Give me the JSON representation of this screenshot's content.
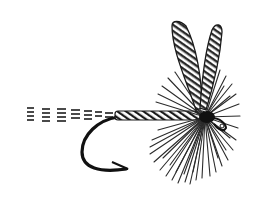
{
  "image": {
    "subject": "Dry fly fishing lure illustration",
    "style": "black-and-white engraving",
    "colors": {
      "background": "#ffffff",
      "ink": "#1a1a1a",
      "mid": "#555555"
    },
    "parts": [
      "tail",
      "hook-shank",
      "hook-bend",
      "hook-point",
      "hackle",
      "wings",
      "head",
      "eye"
    ]
  }
}
